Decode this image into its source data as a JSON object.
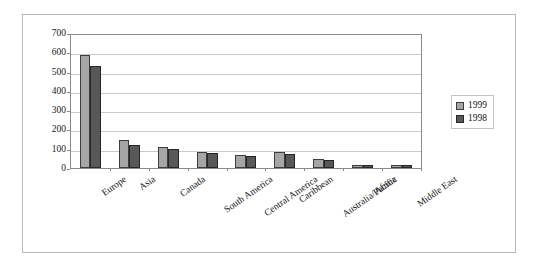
{
  "chart_data": {
    "type": "bar",
    "title": "",
    "xlabel": "",
    "ylabel": "",
    "ylim": [
      0,
      700
    ],
    "yticks": [
      0,
      100,
      200,
      300,
      400,
      500,
      600,
      700
    ],
    "grid": true,
    "legend_position": "right",
    "categories": [
      "Europe",
      "Asia",
      "Canada",
      "South America",
      "Central America",
      "Caribbean",
      "Australia/Pacific",
      "Africa",
      "Middle East"
    ],
    "series": [
      {
        "name": "1999",
        "color": "#a6a6a6",
        "values": [
          585,
          145,
          110,
          85,
          70,
          85,
          45,
          18,
          18
        ]
      },
      {
        "name": "1998",
        "color": "#585858",
        "values": [
          530,
          120,
          100,
          80,
          60,
          75,
          40,
          15,
          15
        ]
      }
    ]
  },
  "legend": {
    "entries": [
      {
        "label": "1999"
      },
      {
        "label": "1998"
      }
    ]
  },
  "colors": {
    "series_1999": "#a6a6a6",
    "series_1998": "#585858",
    "gridline": "#c9c9c9",
    "axis": "#8a8a8a",
    "frame": "#b9b9b9",
    "background": "#ffffff"
  }
}
